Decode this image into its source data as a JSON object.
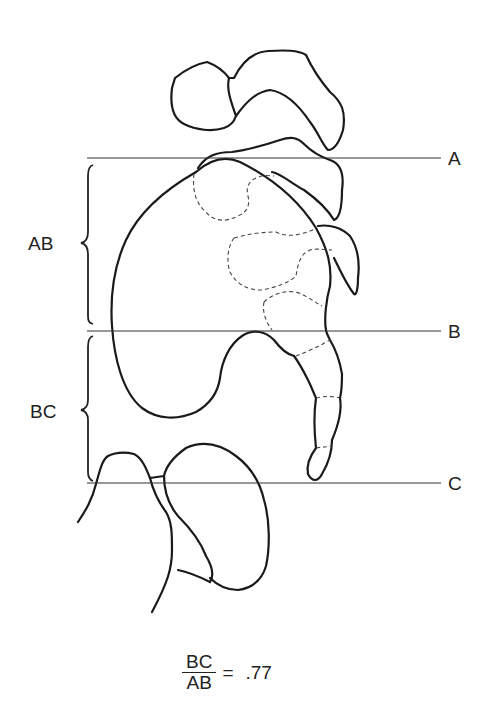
{
  "diagram": {
    "reference_lines": [
      {
        "label": "A",
        "y": 158
      },
      {
        "label": "B",
        "y": 331
      },
      {
        "label": "C",
        "y": 483
      }
    ],
    "braces": [
      {
        "label": "AB"
      },
      {
        "label": "BC"
      }
    ],
    "formula": {
      "numerator": "BC",
      "denominator": "AB",
      "equals": "=",
      "value": ".77"
    }
  }
}
